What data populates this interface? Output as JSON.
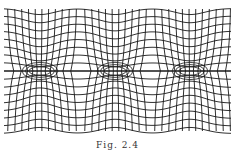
{
  "figure": {
    "caption": "Fig. 2.4",
    "line_color": "#1a1a1a",
    "background": "#ffffff",
    "axis_y": 71,
    "bounds": {
      "left": 4,
      "right": 231,
      "top": 9,
      "bottom": 131
    },
    "slits": [
      {
        "center_x": 40,
        "half_width": 17
      },
      {
        "center_x": 115,
        "half_width": 17
      },
      {
        "center_x": 190,
        "half_width": 17
      }
    ],
    "horizontal_line_count": 17,
    "vertical_line_spacing": 7
  }
}
